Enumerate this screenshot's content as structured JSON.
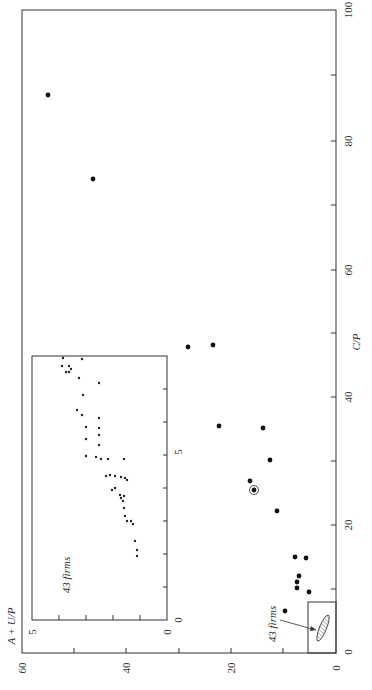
{
  "chart_data": [
    {
      "type": "scatter",
      "title": "",
      "orientation": "rotated 90° counterclockwise on page",
      "xlabel": "C/P",
      "ylabel": "A + U/P",
      "xlim": [
        0,
        100
      ],
      "ylim": [
        0,
        60
      ],
      "x_ticks": [
        0,
        20,
        40,
        60,
        80,
        100
      ],
      "x_minor_ticks": [
        10,
        30,
        50,
        70,
        90
      ],
      "y_ticks": [
        0,
        20,
        40,
        60
      ],
      "y_minor_ticks": [
        10,
        30,
        50
      ],
      "grid": false,
      "annotations": [
        {
          "text": "43 firms",
          "points_to": "hatched cluster region near origin (C/P 0–8, A+U/P 0–5)"
        },
        {
          "text": "circled point",
          "x": 25.2,
          "y": 15.7
        }
      ],
      "series": [
        {
          "name": "firms",
          "points": [
            {
              "x": 86.8,
              "y": 55.1
            },
            {
              "x": 73.7,
              "y": 46.5
            },
            {
              "x": 47.5,
              "y": 28.3
            },
            {
              "x": 47.8,
              "y": 23.5
            },
            {
              "x": 35.2,
              "y": 22.4
            },
            {
              "x": 34.9,
              "y": 14.0
            },
            {
              "x": 29.9,
              "y": 12.6
            },
            {
              "x": 26.6,
              "y": 16.4
            },
            {
              "x": 25.2,
              "y": 15.7,
              "circled": true
            },
            {
              "x": 22.0,
              "y": 11.3
            },
            {
              "x": 14.8,
              "y": 7.8
            },
            {
              "x": 14.6,
              "y": 5.7
            },
            {
              "x": 11.8,
              "y": 7.1
            },
            {
              "x": 10.9,
              "y": 7.5
            },
            {
              "x": 10.0,
              "y": 7.5
            },
            {
              "x": 9.3,
              "y": 5.2
            },
            {
              "x": 6.4,
              "y": 9.8
            }
          ]
        }
      ]
    },
    {
      "type": "scatter",
      "title": "Inset: 43 firms",
      "xlabel": "C/P",
      "ylabel": "A + U/P",
      "xlim": [
        0,
        8
      ],
      "ylim": [
        0,
        5
      ],
      "x_tick_labels": [
        "0",
        "5"
      ],
      "y_tick_labels": [
        "0",
        "5"
      ],
      "annotation": "43 firms",
      "point_count": 43
    }
  ],
  "labels": {
    "x_axis_title": "C/P",
    "y_axis_title": "A + U/P",
    "x_ticks": [
      "0",
      "20",
      "40",
      "60",
      "80",
      "100"
    ],
    "y_ticks": [
      "0",
      "20",
      "40",
      "60"
    ],
    "inset_x_ticks": [
      "0",
      "5"
    ],
    "inset_y_ticks": [
      "0",
      "5"
    ],
    "inset_annotation": "43 firms",
    "main_annotation": "43 firms"
  },
  "screen": {
    "main_points": [
      [
        48,
        95
      ],
      [
        93,
        179
      ],
      [
        188,
        347
      ],
      [
        213,
        345
      ],
      [
        219,
        426
      ],
      [
        263,
        428
      ],
      [
        270,
        460
      ],
      [
        250,
        481
      ],
      [
        277,
        511
      ],
      [
        295,
        557
      ],
      [
        306,
        558
      ],
      [
        299,
        576
      ],
      [
        297,
        582
      ],
      [
        297,
        588
      ],
      [
        309,
        592
      ],
      [
        285,
        611
      ]
    ],
    "circled_point": [
      254,
      490
    ],
    "inset_points": [
      [
        63,
        358
      ],
      [
        62,
        366
      ],
      [
        69,
        366
      ],
      [
        71,
        369
      ],
      [
        66,
        372
      ],
      [
        69,
        372
      ],
      [
        82,
        359
      ],
      [
        79,
        378
      ],
      [
        99,
        383
      ],
      [
        83,
        395
      ],
      [
        77,
        410
      ],
      [
        82,
        415
      ],
      [
        99,
        418
      ],
      [
        86,
        427
      ],
      [
        86,
        439
      ],
      [
        99,
        428
      ],
      [
        99,
        435
      ],
      [
        99,
        445
      ],
      [
        86,
        456
      ],
      [
        96,
        457
      ],
      [
        101,
        459
      ],
      [
        108,
        459
      ],
      [
        124,
        459
      ],
      [
        106,
        476
      ],
      [
        110,
        475
      ],
      [
        115,
        476
      ],
      [
        121,
        477
      ],
      [
        125,
        478
      ],
      [
        127,
        480
      ],
      [
        112,
        490
      ],
      [
        115,
        488
      ],
      [
        120,
        495
      ],
      [
        121,
        498
      ],
      [
        124,
        496
      ],
      [
        123,
        501
      ],
      [
        124,
        508
      ],
      [
        125,
        516
      ],
      [
        127,
        521
      ],
      [
        131,
        521
      ],
      [
        133,
        524
      ],
      [
        135,
        541
      ],
      [
        137,
        550
      ],
      [
        137,
        556
      ]
    ]
  }
}
